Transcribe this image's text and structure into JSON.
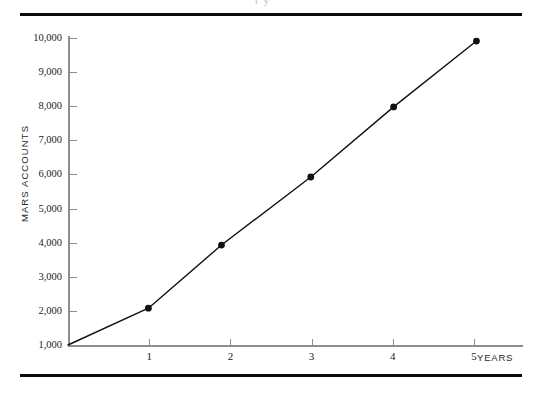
{
  "figure": {
    "clipped_caption_fragment": "r y",
    "rule_color": "#0b0b0b",
    "axis_color": "#8d8d8d",
    "series_color": "#111111"
  },
  "chart_data": {
    "type": "line",
    "title": "",
    "xlabel": "YEARS",
    "ylabel": "MARS ACCOUNTS",
    "xlim": [
      0,
      5.6
    ],
    "ylim": [
      1000,
      10000
    ],
    "grid": false,
    "legend": null,
    "x_ticks": [
      1,
      2,
      3,
      4,
      5
    ],
    "x_tick_labels": [
      "1",
      "2",
      "3",
      "4",
      "5"
    ],
    "y_ticks": [
      1000,
      2000,
      3000,
      4000,
      5000,
      6000,
      7000,
      8000,
      9000,
      10000
    ],
    "y_tick_labels": [
      "1,000",
      "2,000",
      "3,000",
      "4,000",
      "5,000",
      "6,000",
      "7,000",
      "8,000",
      "9,000",
      "10,000"
    ],
    "markers": "filled-circle",
    "series": [
      {
        "name": "Mars Accounts",
        "x": [
          0,
          0.99,
          1.89,
          2.99,
          4.01,
          5.03
        ],
        "y": [
          1000,
          2080,
          3930,
          5925,
          7980,
          9910
        ],
        "point_labels": [
          "",
          "2,080",
          "3,930",
          "5,925",
          "7,980",
          "9,910"
        ],
        "marker_at_origin": false
      }
    ]
  }
}
